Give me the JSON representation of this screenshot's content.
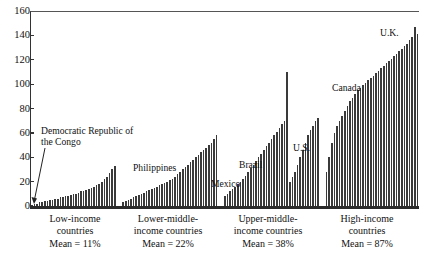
{
  "chart_data": {
    "type": "bar",
    "title": "",
    "xlabel": "",
    "ylabel": "",
    "ylim": [
      0,
      160
    ],
    "ytick_step": 20,
    "yticks": [
      0,
      20,
      40,
      60,
      80,
      100,
      120,
      140,
      160
    ],
    "ytick_labels": [
      "0",
      "20",
      "40",
      "60",
      "80",
      "100",
      "120",
      "140",
      "160"
    ],
    "grid": false,
    "legend": "none",
    "groups": [
      {
        "key": "low-income",
        "label_lines": [
          "Low-income",
          "countries"
        ],
        "mean_label": "Mean = 11%",
        "mean_value": 11,
        "values": [
          1,
          2,
          2,
          3,
          3,
          4,
          4,
          5,
          5,
          6,
          6,
          7,
          7,
          8,
          8,
          9,
          10,
          10,
          11,
          12,
          12,
          13,
          14,
          15,
          16,
          17,
          18,
          20,
          22,
          24,
          27,
          30,
          33
        ]
      },
      {
        "key": "lower-middle-income",
        "label_lines": [
          "Lower-middle-",
          "income countries"
        ],
        "mean_label": "Mean = 22%",
        "mean_value": 22,
        "values": [
          3,
          4,
          5,
          6,
          7,
          8,
          9,
          10,
          11,
          12,
          13,
          14,
          15,
          16,
          17,
          18,
          19,
          20,
          21,
          22,
          24,
          26,
          28,
          30,
          32,
          34,
          36,
          38,
          40,
          42,
          44,
          46,
          48,
          50,
          52,
          55,
          58
        ]
      },
      {
        "key": "upper-middle-income",
        "label_lines": [
          "Upper-middle-",
          "income countries"
        ],
        "mean_label": "Mean = 38%",
        "mean_value": 38,
        "values": [
          8,
          10,
          12,
          14,
          16,
          18,
          20,
          22,
          25,
          28,
          31,
          34,
          37,
          40,
          43,
          46,
          49,
          52,
          55,
          58,
          61,
          64,
          67,
          70,
          110,
          20,
          24,
          28,
          34,
          40,
          46,
          52,
          58,
          62,
          66,
          70,
          72
        ]
      },
      {
        "key": "high-income",
        "label_lines": [
          "High-income",
          "countries"
        ],
        "mean_label": "Mean = 87%",
        "mean_value": 87,
        "values": [
          28,
          40,
          52,
          60,
          66,
          70,
          74,
          78,
          82,
          86,
          89,
          92,
          95,
          97,
          99,
          101,
          103,
          105,
          107,
          109,
          111,
          113,
          115,
          117,
          119,
          121,
          123,
          125,
          127,
          129,
          131,
          133,
          136,
          139,
          147,
          141
        ]
      }
    ],
    "annotations": [
      {
        "key": "drc",
        "text": "Democratic Republic of the Congo",
        "group": "low-income"
      },
      {
        "key": "philippines",
        "text": "Philippines",
        "group": "lower-middle-income"
      },
      {
        "key": "mexico",
        "text": "Mexico",
        "group": "upper-middle-income"
      },
      {
        "key": "brazil",
        "text": "Brazil",
        "group": "upper-middle-income"
      },
      {
        "key": "us",
        "text": "U.S.",
        "group": "upper-middle-income"
      },
      {
        "key": "canada",
        "text": "Canada",
        "group": "high-income"
      },
      {
        "key": "uk",
        "text": "U.K.",
        "group": "high-income"
      }
    ]
  },
  "axis": {
    "y": {
      "t0": "0",
      "t20": "20",
      "t40": "40",
      "t60": "60",
      "t80": "80",
      "t100": "100",
      "t120": "120",
      "t140": "140",
      "t160": "160"
    }
  },
  "captions": {
    "g1l1": "Low-income",
    "g1l2": "countries",
    "g1mean": "Mean = 11%",
    "g2l1": "Lower-middle-",
    "g2l2": "income countries",
    "g2mean": "Mean = 22%",
    "g3l1": "Upper-middle-",
    "g3l2": "income countries",
    "g3mean": "Mean = 38%",
    "g4l1": "High-income",
    "g4l2": "countries",
    "g4mean": "Mean = 87%"
  },
  "annotations": {
    "drc": "Democratic Republic of the Congo",
    "philippines": "Philippines",
    "mexico": "Mexico",
    "brazil": "Brazil",
    "us": "U.S.",
    "canada": "Canada",
    "uk": "U.K."
  },
  "colors": {
    "bar": "#3a3a3a",
    "axis": "#2b2b2b",
    "text": "#111111",
    "background": "#ffffff"
  }
}
